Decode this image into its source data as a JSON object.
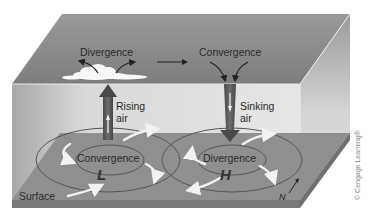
{
  "diagram": {
    "upper_labels": {
      "left": "Divergence",
      "right": "Convergence"
    },
    "column_labels": {
      "rising_line1": "Rising",
      "rising_line2": "air",
      "sinking_line1": "Sinking",
      "sinking_line2": "air"
    },
    "surface_labels": {
      "left_center": "Convergence",
      "right_center": "Divergence",
      "surface": "Surface",
      "low_symbol": "L",
      "high_symbol": "H",
      "north": "N"
    },
    "credit": "© Cengage Learning®",
    "icons": [
      "cloud-icon",
      "rising-air-arrow",
      "sinking-air-arrow",
      "north-arrow-icon",
      "flow-arrow"
    ],
    "colors": {
      "box_top": "#8e8e8e",
      "box_front": "#d6d6d6",
      "surface": "#8f8f8f",
      "column_rising": "#5a5a5a",
      "column_sinking": "#5a5a5a",
      "text": "#2a2a2a"
    }
  }
}
